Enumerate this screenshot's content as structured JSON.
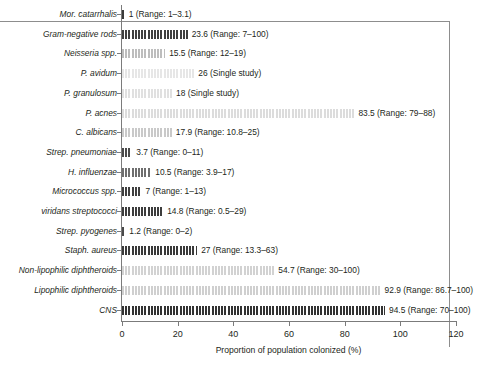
{
  "chart_data": {
    "type": "bar",
    "orientation": "horizontal",
    "title": "",
    "xlabel": "Proportion of population colonized (%)",
    "ylabel": "",
    "xlim": [
      0,
      120
    ],
    "xticks": [
      0,
      20,
      40,
      60,
      80,
      100,
      120
    ],
    "xticklabels": [
      "0",
      "20",
      "40",
      "60",
      "80",
      "100",
      "120"
    ],
    "grid": false,
    "legend": "none",
    "categories": [
      "Mor. catarrhalis",
      "Gram-negative rods",
      "Neisseria spp.",
      "P. avidum",
      "P. granulosum",
      "P. acnes",
      "C. albicans",
      "Strep. pneumoniae",
      "H. influenzae",
      "Micrococcus spp.",
      "viridans streptococci",
      "Strep. pyogenes",
      "Staph. aureus",
      "Non-lipophilic diphtheroids",
      "Lipophilic diphtheroids",
      "CNS"
    ],
    "values": [
      1,
      23.6,
      15.5,
      26,
      18,
      83.5,
      17.9,
      3.7,
      10.5,
      7,
      14.8,
      1.2,
      27,
      54.7,
      92.9,
      94.5
    ],
    "annotations": [
      "1 (Range: 1–3.1)",
      "23.6 (Range: 7–100)",
      "15.5 (Range: 12–19)",
      "26 (Single study)",
      "18 (Single study)",
      "83.5 (Range: 79–88)",
      "17.9 (Range: 10.8–25)",
      "3.7 (Range: 0–11)",
      "10.5 (Range: 3.9–17)",
      "7 (Range: 1–13)",
      "14.8 (Range: 0.5–29)",
      "1.2 (Range: 0–2)",
      "27 (Range: 13.3–63)",
      "54.7 (Range: 30–100)",
      "92.9 (Range: 86.7–100)",
      "94.5 (Range: 70–100)"
    ],
    "bar_shades": [
      "#3a3a3a",
      "#3f3f3f",
      "#bdbdbd",
      "#e6e6e6",
      "#e0e0e0",
      "#dcdcdc",
      "#c9c9c9",
      "#4a4a4a",
      "#6e6e6e",
      "#3f3f3f",
      "#3d3d3d",
      "#4a4a4a",
      "#3a3a3a",
      "#d2d2d2",
      "#cfcfcf",
      "#333333"
    ],
    "bar_pattern": "vertical-hatch"
  },
  "axis": {
    "x_title": "Proportion of population colonized (%)"
  }
}
